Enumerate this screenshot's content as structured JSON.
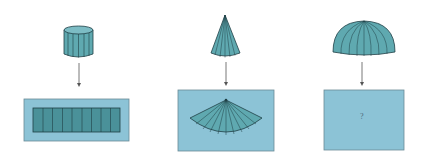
{
  "colors": {
    "solid_fill": "#5fa9b0",
    "solid_dark": "#4a9199",
    "outline": "#1f3f45",
    "panel_fill": "#8cc3d6",
    "panel_border": "#6a8a96",
    "arrow": "#555555",
    "background": "#ffffff"
  },
  "figures": [
    {
      "solid": "cylinder",
      "net": "rectangle-strips",
      "net_label": ""
    },
    {
      "solid": "cone",
      "net": "circular-sector",
      "net_label": ""
    },
    {
      "solid": "hemisphere",
      "net": "unknown",
      "net_label": "?"
    }
  ]
}
